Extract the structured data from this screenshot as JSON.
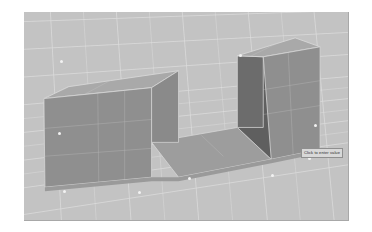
{
  "app": {
    "title": "3D Modeling Viewport",
    "viewport_name": "perspective-view"
  },
  "viewport": {
    "background_color": "#c3c3c3",
    "grid_color": "#e8e8e8",
    "grid_visible": true,
    "border_color": "#a8a8a8"
  },
  "model": {
    "name": "channel-block-solid",
    "description": "U-shaped extruded channel solid",
    "faces": {
      "top_color": "#a9a9a9",
      "front_color": "#8f8f8f",
      "left_color": "#6e6e6e",
      "inner_color": "#5f5f5f",
      "floor_color": "#9d9d9d",
      "edge_color": "#d6d6d6"
    }
  },
  "tooltip": {
    "text": "Click to enter value",
    "visible": true
  },
  "markers": {
    "label": "vertex-snap-point",
    "color": "#f2f2f2",
    "points": [
      {
        "x": 36,
        "y": 48
      },
      {
        "x": 215,
        "y": 42
      },
      {
        "x": 34,
        "y": 120
      },
      {
        "x": 39,
        "y": 178
      },
      {
        "x": 114,
        "y": 179
      },
      {
        "x": 164,
        "y": 165
      },
      {
        "x": 247,
        "y": 162
      },
      {
        "x": 284,
        "y": 145
      },
      {
        "x": 290,
        "y": 112
      }
    ]
  }
}
